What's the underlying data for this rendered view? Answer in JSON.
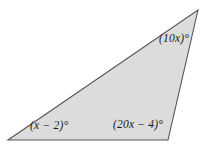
{
  "figure": {
    "type": "triangle-angle-diagram",
    "background_color": "#ffffff",
    "fill_color": "#dcdcdc",
    "stroke_color": "#555555",
    "vertices": {
      "top_right": {
        "x": 198,
        "y": 10
      },
      "bottom_left": {
        "x": 8,
        "y": 140
      },
      "bottom_right": {
        "x": 168,
        "y": 140
      }
    },
    "labels": {
      "top_right_angle": "(10x)°",
      "bottom_left_angle": "(x − 2)°",
      "bottom_right_angle": "(20x − 4)°"
    }
  }
}
